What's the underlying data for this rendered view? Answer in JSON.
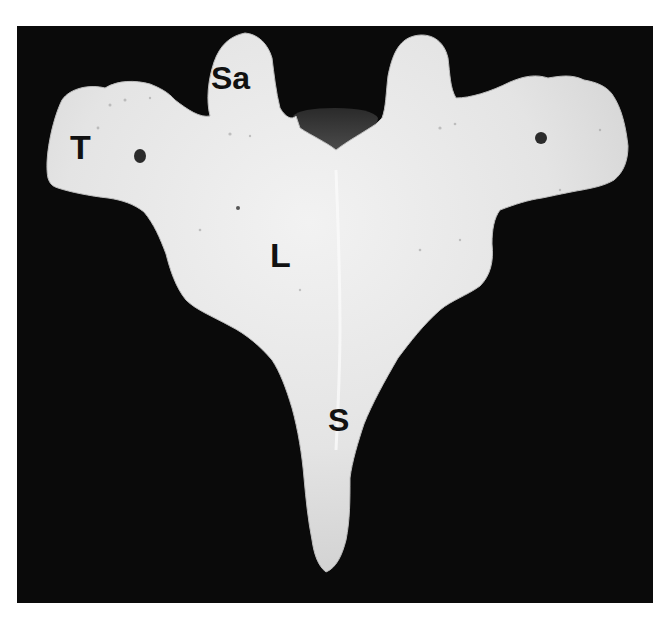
{
  "figure": {
    "background_color": "#0a0a0a",
    "bone_color": "#e6e6e6",
    "label_color": "#111111",
    "labels": [
      {
        "id": "T",
        "text": "T"
      },
      {
        "id": "Sa",
        "text": "Sa"
      },
      {
        "id": "L",
        "text": "L"
      },
      {
        "id": "S",
        "text": "S"
      }
    ]
  }
}
